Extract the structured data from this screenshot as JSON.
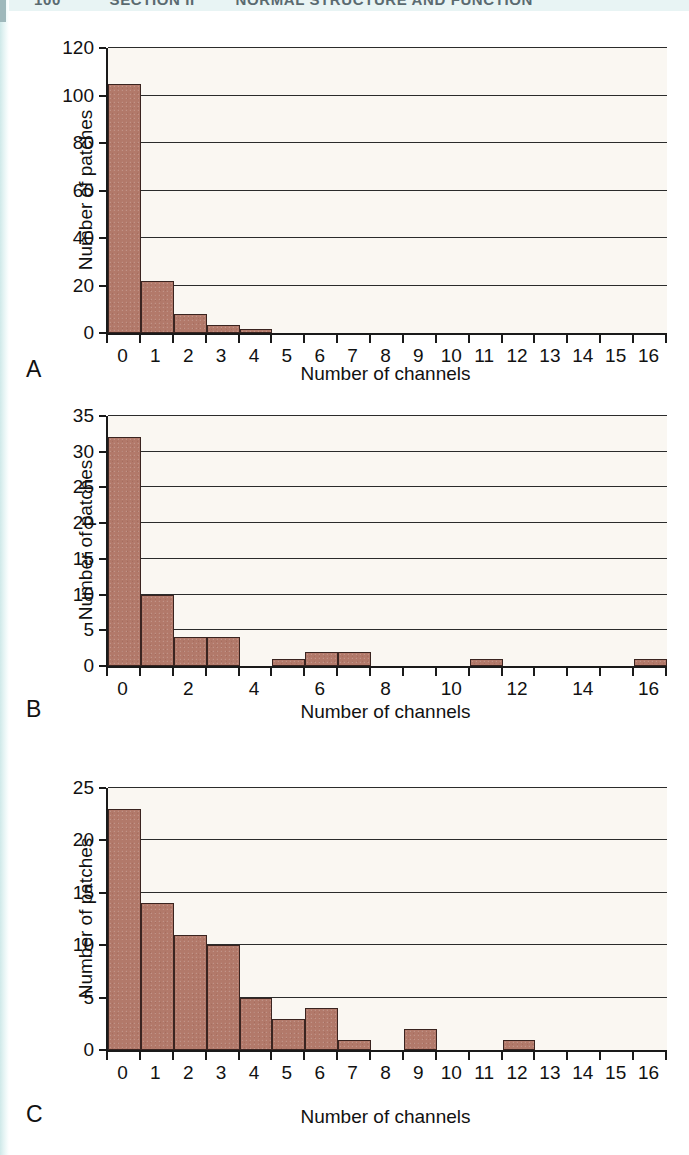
{
  "page_header": {
    "folio": "100",
    "section": "SECTION II",
    "title": "NORMAL STRUCTURE AND FUNCTION"
  },
  "figure": {
    "panels": [
      {
        "letter": "A",
        "chart_index": 0
      },
      {
        "letter": "B",
        "chart_index": 1
      },
      {
        "letter": "C",
        "chart_index": 2
      }
    ]
  },
  "chart_data": [
    {
      "type": "bar",
      "panel": "A",
      "title": "",
      "xlabel": "Number of channels",
      "ylabel": "Number of patches",
      "categories": [
        "0",
        "1",
        "2",
        "3",
        "4",
        "5",
        "6",
        "7",
        "8",
        "9",
        "10",
        "11",
        "12",
        "13",
        "14",
        "15",
        "16"
      ],
      "values": [
        105,
        22,
        8,
        3.5,
        1.5,
        0,
        0,
        0,
        0,
        0,
        0,
        0,
        0,
        0,
        0,
        0,
        0
      ],
      "ylim": [
        0,
        120
      ],
      "ytick_labels": [
        "0",
        "20",
        "40",
        "60",
        "80",
        "100",
        "120"
      ],
      "ytick_values": [
        0,
        20,
        40,
        60,
        80,
        100,
        120
      ],
      "xtick_labels": [
        "0",
        "1",
        "2",
        "3",
        "4",
        "5",
        "6",
        "7",
        "8",
        "9",
        "10",
        "11",
        "12",
        "13",
        "14",
        "15",
        "16"
      ],
      "xlim": [
        -0.5,
        16.5
      ],
      "grid": true,
      "legend": "none",
      "bar_color": "#b2796a",
      "bar_edge_color": "#3a2420",
      "plot_background": "#faf7f2"
    },
    {
      "type": "bar",
      "panel": "B",
      "title": "",
      "xlabel": "Number of channels",
      "ylabel": "Number of patches",
      "categories": [
        "0",
        "1",
        "2",
        "3",
        "4",
        "5",
        "6",
        "7",
        "8",
        "9",
        "10",
        "11",
        "12",
        "13",
        "14",
        "15",
        "16"
      ],
      "values": [
        32,
        10,
        4,
        4,
        0,
        1,
        2,
        2,
        0,
        0,
        0,
        1,
        0,
        0,
        0,
        0,
        1
      ],
      "ylim": [
        0,
        35
      ],
      "ytick_labels": [
        "0",
        "5",
        "10",
        "15",
        "20",
        "25",
        "30",
        "35"
      ],
      "ytick_values": [
        0,
        5,
        10,
        15,
        20,
        25,
        30,
        35
      ],
      "xtick_labels": [
        "0",
        "",
        "2",
        "",
        "4",
        "",
        "6",
        "",
        "8",
        "",
        "10",
        "",
        "12",
        "",
        "14",
        "",
        "16"
      ],
      "xlim": [
        -0.5,
        16.5
      ],
      "grid": true,
      "legend": "none",
      "bar_color": "#b2796a",
      "bar_edge_color": "#3a2420",
      "plot_background": "#faf7f2"
    },
    {
      "type": "bar",
      "panel": "C",
      "title": "",
      "xlabel": "Number of channels",
      "ylabel": "Number of patches",
      "categories": [
        "0",
        "1",
        "2",
        "3",
        "4",
        "5",
        "6",
        "7",
        "8",
        "9",
        "10",
        "11",
        "12",
        "13",
        "14",
        "15",
        "16"
      ],
      "values": [
        23,
        14,
        11,
        10,
        5,
        3,
        4,
        1,
        0,
        2,
        0,
        0,
        1,
        0,
        0,
        0,
        0
      ],
      "ylim": [
        0,
        25
      ],
      "ytick_labels": [
        "0",
        "5",
        "10",
        "15",
        "20",
        "25"
      ],
      "ytick_values": [
        0,
        5,
        10,
        15,
        20,
        25
      ],
      "xtick_labels": [
        "0",
        "1",
        "2",
        "3",
        "4",
        "5",
        "6",
        "7",
        "8",
        "9",
        "10",
        "11",
        "12",
        "13",
        "14",
        "15",
        "16"
      ],
      "xlim": [
        -0.5,
        16.5
      ],
      "grid": true,
      "legend": "none",
      "bar_color": "#b2796a",
      "bar_edge_color": "#3a2420",
      "plot_background": "#faf7f2"
    }
  ]
}
